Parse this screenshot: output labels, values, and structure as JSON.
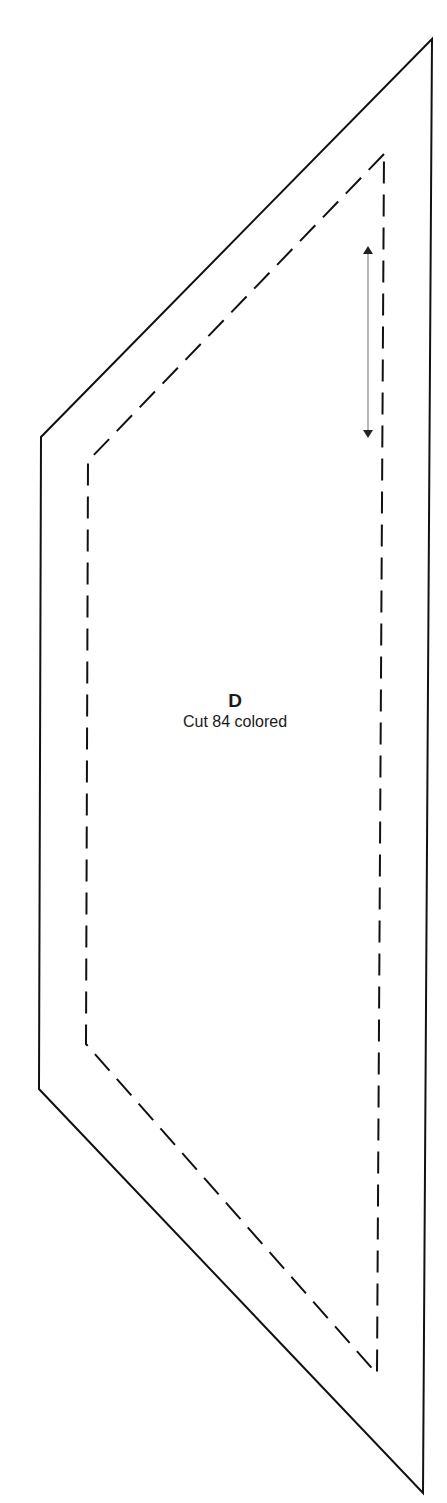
{
  "pattern_piece": {
    "letter": "D",
    "instruction": "Cut 84 colored",
    "colors": {
      "cut_line": "#111111",
      "seam_line": "#111111",
      "grain_arrow": "#777777"
    },
    "cut_line_points": "432,39 41,437 39,1089 423,1493",
    "seam_line_points": "384,154 88,461 86,1044 377,1374",
    "grain_arrow": {
      "x": 368,
      "y1": 246,
      "y2": 438
    }
  }
}
